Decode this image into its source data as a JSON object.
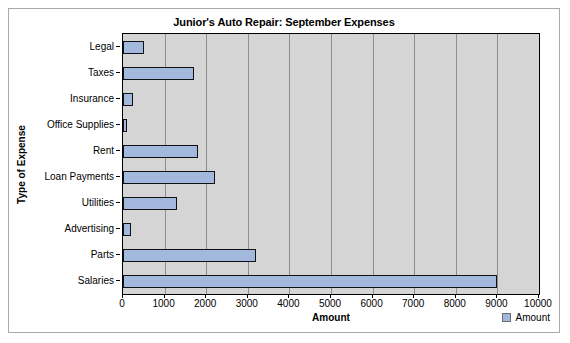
{
  "chart_data": {
    "type": "bar",
    "orientation": "horizontal",
    "title": "Junior's Auto Repair: September Expenses",
    "xlabel": "Amount",
    "ylabel": "Type of Expense",
    "categories": [
      "Legal",
      "Taxes",
      "Insurance",
      "Office Supplies",
      "Rent",
      "Loan Payments",
      "Utilities",
      "Advertising",
      "Parts",
      "Salaries"
    ],
    "values": [
      500,
      1700,
      250,
      100,
      1800,
      2200,
      1300,
      200,
      3200,
      9000
    ],
    "series": [
      {
        "name": "Amount",
        "values": [
          500,
          1700,
          250,
          100,
          1800,
          2200,
          1300,
          200,
          3200,
          9000
        ]
      }
    ],
    "xlim": [
      0,
      10000
    ],
    "xticks": [
      0,
      1000,
      2000,
      3000,
      4000,
      5000,
      6000,
      7000,
      8000,
      9000,
      10000
    ],
    "xtick_labels": [
      "0",
      "1000",
      "2000",
      "3000",
      "4000",
      "5000",
      "6000",
      "7000",
      "8000",
      "9000",
      "10000"
    ],
    "grid": "vertical",
    "legend": {
      "position": "bottom-right",
      "entries": [
        "Amount"
      ]
    },
    "colors": {
      "bar_fill": "#a3b8dd",
      "bar_border": "#111111",
      "plot_background": "#d5d5d5",
      "gridline": "#8d8d8d",
      "frame_border": "#a9a9a9",
      "canvas_background": "#ffffff"
    }
  }
}
